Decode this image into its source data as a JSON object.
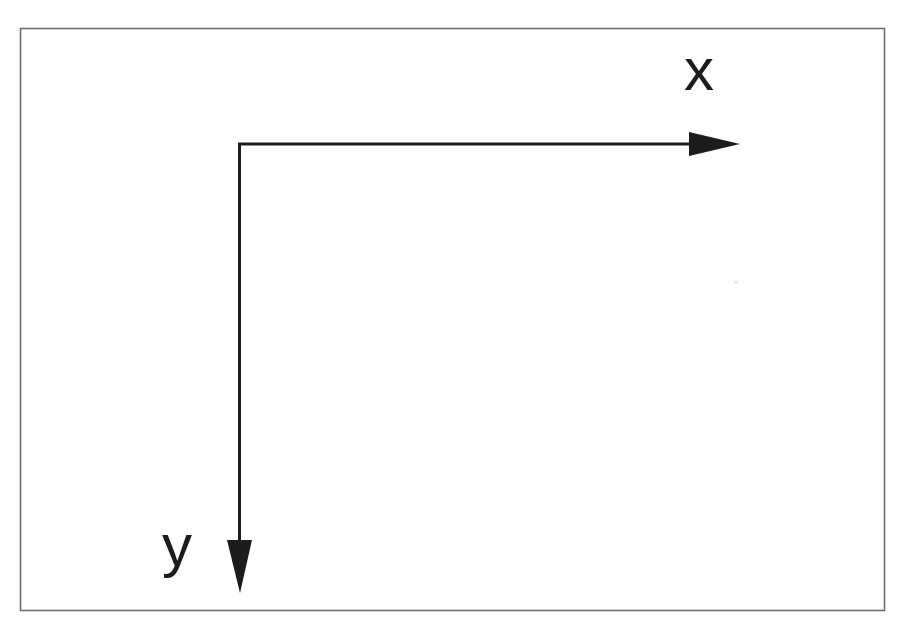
{
  "diagram": {
    "axes": {
      "x": {
        "label": "x",
        "direction": "right"
      },
      "y": {
        "label": "y",
        "direction": "down"
      }
    },
    "colors": {
      "axis": "#1c1c1c",
      "frame": "#6e6e6e",
      "background": "#ffffff"
    }
  }
}
